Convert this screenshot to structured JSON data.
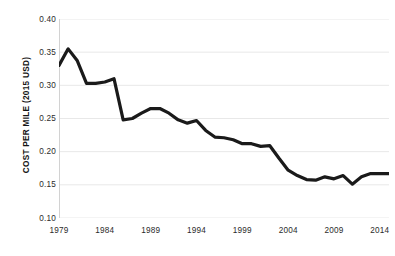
{
  "chart_data": {
    "type": "line",
    "title": "",
    "xlabel": "",
    "ylabel": "COST PER MILE (2015 USD)",
    "xlim": [
      1979,
      2015
    ],
    "ylim": [
      0.1,
      0.4
    ],
    "grid": true,
    "legend": false,
    "legend_position": "none",
    "line_color": "#1a1a1a",
    "grid_color": "#e8e8e8",
    "axis_color": "#d2d2d2",
    "background_color": "#ffffff",
    "y_ticks": [
      "0.40",
      "0.35",
      "0.30",
      "0.25",
      "0.20",
      "0.15",
      "0.10"
    ],
    "y_tick_values": [
      0.4,
      0.35,
      0.3,
      0.25,
      0.2,
      0.15,
      0.1
    ],
    "x_ticks": [
      "1979",
      "1984",
      "1989",
      "1994",
      "1999",
      "2004",
      "2009",
      "2014"
    ],
    "x_tick_values": [
      1979,
      1984,
      1989,
      1994,
      1999,
      2004,
      2009,
      2014
    ],
    "x": [
      1979,
      1980,
      1981,
      1982,
      1983,
      1984,
      1985,
      1986,
      1987,
      1988,
      1989,
      1990,
      1991,
      1992,
      1993,
      1994,
      1995,
      1996,
      1997,
      1998,
      1999,
      2000,
      2001,
      2002,
      2003,
      2004,
      2005,
      2006,
      2007,
      2008,
      2009,
      2010,
      2011,
      2012,
      2013,
      2014,
      2015
    ],
    "values": [
      0.33,
      0.355,
      0.337,
      0.303,
      0.303,
      0.305,
      0.31,
      0.248,
      0.25,
      0.258,
      0.265,
      0.265,
      0.258,
      0.248,
      0.243,
      0.247,
      0.232,
      0.222,
      0.221,
      0.218,
      0.212,
      0.212,
      0.208,
      0.209,
      0.19,
      0.172,
      0.164,
      0.158,
      0.157,
      0.162,
      0.159,
      0.164,
      0.151,
      0.162,
      0.167,
      0.167,
      0.167
    ],
    "series_name": "Cost per mile"
  }
}
